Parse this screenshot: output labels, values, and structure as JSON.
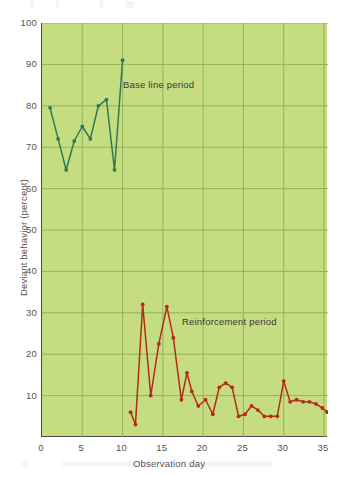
{
  "figure": {
    "background_color": "#ffffff",
    "plot_background_color": "#c6dc81",
    "grid_color": "#8fae55",
    "axis_color": "#4a4a48"
  },
  "annotations": [
    {
      "id": "baseline",
      "text": "Base line period",
      "color": "#3b3b38"
    },
    {
      "id": "reinforcement",
      "text": "Reinforcement period",
      "color": "#3b3b38"
    }
  ],
  "chart_data": {
    "type": "line",
    "title": "",
    "xlabel": "Observation day",
    "ylabel": "Deviant behavior (percent)",
    "xlim": [
      0,
      35.5
    ],
    "ylim": [
      0,
      100
    ],
    "xticks": [
      0,
      5,
      10,
      15,
      20,
      25,
      30,
      35
    ],
    "yticks": [
      10,
      20,
      30,
      40,
      50,
      60,
      70,
      80,
      90,
      100
    ],
    "xtick_labels": [
      "0",
      "5",
      "10",
      "15",
      "20",
      "25",
      "30",
      "35"
    ],
    "ytick_labels": [
      "10",
      "20",
      "30",
      "40",
      "50",
      "60",
      "70",
      "80",
      "90",
      "100"
    ],
    "grid": true,
    "legend": "none",
    "markers": "circle",
    "annotations": [
      "Base line period",
      "Reinforcement period"
    ],
    "series": [
      {
        "name": "Base line period",
        "color": "#2f7a53",
        "x": [
          1,
          2,
          3,
          4,
          5,
          6,
          7,
          8,
          9,
          10
        ],
        "values": [
          79.5,
          72,
          64.5,
          71.5,
          75,
          72,
          80,
          81.5,
          64.5,
          91
        ]
      },
      {
        "name": "Reinforcement period",
        "color": "#b52a18",
        "x": [
          11,
          11.6,
          12.5,
          13.5,
          14.5,
          15.5,
          16.3,
          17.3,
          18,
          18.6,
          19.4,
          20.3,
          21.2,
          22,
          22.8,
          23.6,
          24.4,
          25.2,
          26,
          26.8,
          27.6,
          28.4,
          29.2,
          30,
          30.8,
          31.6,
          32.4,
          33.2,
          34,
          34.8,
          35.4
        ],
        "values": [
          6,
          3,
          32,
          10,
          22.5,
          31.5,
          24,
          9,
          15.5,
          11,
          7.5,
          9,
          5.5,
          12,
          13,
          12,
          5,
          5.5,
          7.5,
          6.5,
          5,
          5,
          5,
          13.5,
          8.5,
          9,
          8.5,
          8.5,
          8,
          7,
          6
        ]
      }
    ]
  }
}
